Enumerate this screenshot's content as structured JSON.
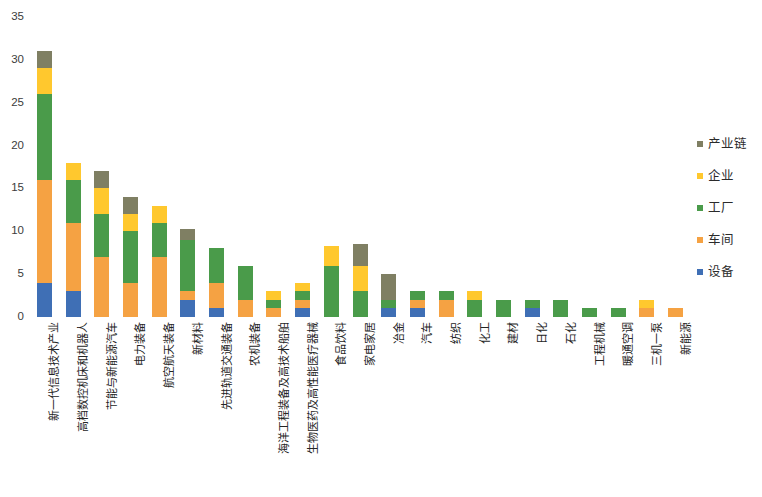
{
  "chart_data": {
    "type": "bar",
    "title": "",
    "subtitle": "",
    "xlabel": "",
    "ylabel": "",
    "stacked": true,
    "grid": false,
    "legend_position": "right",
    "ylim": [
      0,
      35
    ],
    "yticks": [
      0,
      5,
      10,
      15,
      20,
      25,
      30,
      35
    ],
    "ytick_labels": [
      "0",
      "5",
      "10",
      "15",
      "20",
      "25",
      "30",
      "35"
    ],
    "categories": [
      "新一代信息技术产业",
      "高档数控机床和机器人",
      "节能与新能源汽车",
      "电力装备",
      "航空航天装备",
      "新材料",
      "先进轨道交通装备",
      "农机装备",
      "海洋工程装备及高技术船舶",
      "生物医药及高性能医疗器械",
      "食品饮料",
      "家电家居",
      "冶金",
      "汽车",
      "纺织",
      "化工",
      "建材",
      "日化",
      "石化",
      "工程机械",
      "暖通空调",
      "三机一泵",
      "新能源"
    ],
    "series": [
      {
        "name": "设备",
        "color": "#3f6fb5",
        "values": [
          4,
          3,
          0,
          0,
          0,
          2,
          1,
          0,
          0,
          1,
          0,
          0,
          1,
          1,
          0,
          0,
          0,
          1,
          0,
          0,
          0,
          0,
          0
        ]
      },
      {
        "name": "车间",
        "color": "#f5a243",
        "values": [
          12,
          8,
          7,
          4,
          7,
          1,
          3,
          2,
          1,
          1,
          0,
          0,
          0,
          1,
          2,
          0,
          0,
          0,
          0,
          0,
          0,
          1,
          1
        ]
      },
      {
        "name": "工厂",
        "color": "#4a9b4a",
        "values": [
          10,
          5,
          5,
          6,
          4,
          6,
          4,
          4,
          1,
          1,
          6,
          3,
          1,
          1,
          1,
          2,
          2,
          1,
          2,
          1,
          1,
          0,
          0
        ]
      },
      {
        "name": "企业",
        "color": "#ffc82e",
        "values": [
          3,
          2,
          3,
          2,
          2,
          0,
          0,
          0,
          1,
          1,
          2.3,
          3,
          0,
          0,
          0,
          1,
          0,
          0,
          0,
          0,
          0,
          1,
          0
        ]
      },
      {
        "name": "产业链",
        "color": "#7f7f63",
        "values": [
          2,
          0,
          2,
          2,
          0,
          1.3,
          0,
          0,
          0,
          0,
          0,
          2.5,
          3,
          0,
          0,
          0,
          0,
          0,
          0,
          0,
          0,
          0,
          0
        ]
      }
    ],
    "totals": [
      31,
      18,
      17,
      14,
      13,
      10.3,
      8,
      6,
      3,
      4.3,
      8.3,
      8.5,
      5,
      3,
      3,
      3,
      2,
      2,
      2,
      1,
      1,
      2,
      1
    ]
  },
  "legend": {
    "items": [
      {
        "label": "产业链",
        "color": "#7f7f63",
        "key": "chain"
      },
      {
        "label": "企业",
        "color": "#ffc82e",
        "key": "enterprise"
      },
      {
        "label": "工厂",
        "color": "#4a9b4a",
        "key": "factory"
      },
      {
        "label": "车间",
        "color": "#f5a243",
        "key": "workshop"
      },
      {
        "label": "设备",
        "color": "#3f6fb5",
        "key": "equipment"
      }
    ]
  }
}
